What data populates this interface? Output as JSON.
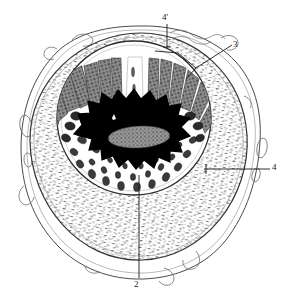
{
  "figure": {
    "type": "histological-cross-section-illustration",
    "background_color": "#ffffff",
    "ink_color": "#1a1a1a",
    "texture_color": "#6b6b6b",
    "lumen_color": "#000000",
    "mucosa_color": "#4a4a4a"
  },
  "labels": [
    {
      "id": "label-4prime",
      "text": "4'",
      "position": "top",
      "leader": "vertical line downward into outer layer"
    },
    {
      "id": "label-3",
      "text": "3",
      "position": "upper-right",
      "leader": "branching line to inner boundary layers"
    },
    {
      "id": "label-4",
      "text": "4",
      "position": "right",
      "leader": "horizontal line leftward with tick terminus"
    },
    {
      "id": "label-2",
      "text": "2",
      "position": "bottom",
      "leader": "vertical line upward into glandular zone"
    }
  ],
  "structures": {
    "outer_serosa": "irregular outer contour with small oval blebs",
    "muscular_layer": "broad stippled ring of short dashes",
    "inner_boundary": "dark circular line enclosing mucosa",
    "mucosa_villi": "radiating dark folds in upper half",
    "glands": "clustered dark granular profiles in lower half",
    "lumen": "central star-shaped black cavity",
    "lumen_inclusion": "gray mottled mass inside lumen"
  }
}
